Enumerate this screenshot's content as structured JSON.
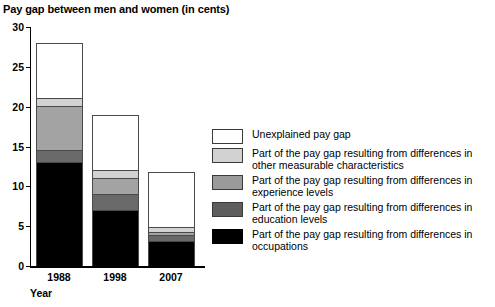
{
  "chart_data": {
    "type": "bar",
    "title": "Pay gap between men and women (in cents)",
    "xlabel": "Year",
    "ylabel": "",
    "categories": [
      "1988",
      "1998",
      "2007"
    ],
    "ylim": [
      0,
      30
    ],
    "yticks": [
      0,
      5,
      10,
      15,
      20,
      25,
      30
    ],
    "grid": false,
    "stacked": true,
    "legend_position": "right",
    "series": [
      {
        "name": "Part of the pay gap resulting from differences in occupations",
        "key": "occupations",
        "color": "#000000",
        "values": [
          13.0,
          7.0,
          3.0
        ]
      },
      {
        "name": "Part of the pay gap resulting from differences in education levels",
        "key": "education",
        "color": "#696969",
        "values": [
          1.5,
          2.0,
          0.8
        ]
      },
      {
        "name": "Part of the pay gap resulting from differences in experience levels",
        "key": "experience",
        "color": "#a3a3a3",
        "values": [
          5.5,
          2.0,
          0.4
        ]
      },
      {
        "name": "Part of the pay gap resulting from differences in other measurable characteristics",
        "key": "other",
        "color": "#d2d2d2",
        "values": [
          1.0,
          1.0,
          0.6
        ]
      },
      {
        "name": "Unexplained pay gap",
        "key": "unexplained",
        "color": "#ffffff",
        "values": [
          7.0,
          7.0,
          7.0
        ]
      }
    ],
    "totals": [
      28.0,
      19.0,
      11.8
    ]
  },
  "axis": {
    "y_tick_labels": [
      "0",
      "5",
      "10",
      "15",
      "20",
      "25",
      "30"
    ],
    "x_tick_labels": [
      "1988",
      "1998",
      "2007"
    ],
    "x_axis_title": "Year"
  },
  "legend": {
    "entries": [
      {
        "swatch": "unexplained",
        "label": "Unexplained pay gap"
      },
      {
        "swatch": "other",
        "label": "Part of the pay gap resulting from differences in other measurable characteristics"
      },
      {
        "swatch": "experience",
        "label": "Part of the pay gap resulting from differences in experience levels"
      },
      {
        "swatch": "education",
        "label": "Part of the pay gap resulting from differences in education levels"
      },
      {
        "swatch": "occupations",
        "label": "Part of the pay gap resulting from differences in occupations"
      }
    ]
  }
}
